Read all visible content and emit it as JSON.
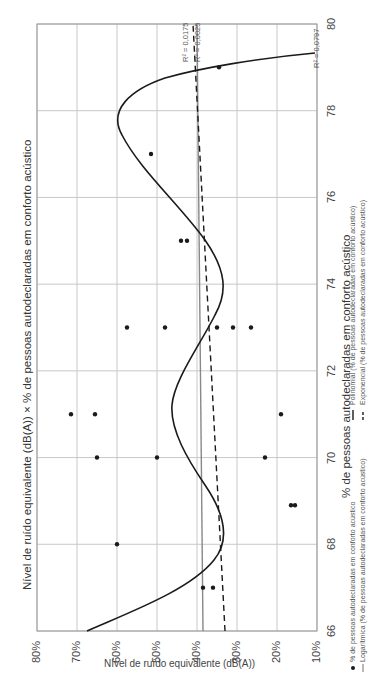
{
  "chart_data": {
    "type": "scatter",
    "orientation": "rotated-90-ccw",
    "title": "Nível de ruído equivalente (dB(A)) × % de pessoas autodeclaradas em conforto acústico",
    "xlabel": "Nível de ruído equivalente (dB(A))",
    "ylabel": "% de pessoas autodeclaradas em conforto acústico",
    "xlim": [
      66,
      80
    ],
    "ylim": [
      0.1,
      0.8
    ],
    "x_ticks": [
      "66",
      "68",
      "70",
      "72",
      "74",
      "76",
      "78",
      "80"
    ],
    "y_ticks": [
      "80%",
      "70%",
      "60%",
      "50%",
      "40%",
      "30%",
      "20%",
      "10%"
    ],
    "grid": true,
    "series": [
      {
        "name": "% de pessoas autodeclaradas em conforto acústico",
        "kind": "points",
        "points": [
          {
            "x": 67,
            "y": 0.385
          },
          {
            "x": 67,
            "y": 0.36
          },
          {
            "x": 68,
            "y": 0.6
          },
          {
            "x": 68.9,
            "y": 0.165
          },
          {
            "x": 68.9,
            "y": 0.155
          },
          {
            "x": 70,
            "y": 0.65
          },
          {
            "x": 70,
            "y": 0.5
          },
          {
            "x": 70,
            "y": 0.23
          },
          {
            "x": 71,
            "y": 0.715
          },
          {
            "x": 71,
            "y": 0.655
          },
          {
            "x": 71,
            "y": 0.19
          },
          {
            "x": 73,
            "y": 0.575
          },
          {
            "x": 73,
            "y": 0.48
          },
          {
            "x": 73,
            "y": 0.35
          },
          {
            "x": 73,
            "y": 0.31
          },
          {
            "x": 73,
            "y": 0.265
          },
          {
            "x": 75,
            "y": 0.44
          },
          {
            "x": 75,
            "y": 0.425
          },
          {
            "x": 77,
            "y": 0.515
          },
          {
            "x": 79,
            "y": 0.345
          }
        ]
      },
      {
        "name": "Logarítmica (% de pessoas autodeclaradas em conforto acústico)",
        "kind": "trendline",
        "style": "solid-gray",
        "r2": "R² = 0,0025",
        "y_at_66": 0.385,
        "y_at_80": 0.4
      },
      {
        "name": "Polinomial (% de pessoas autodeclaradas em conforto acústico)",
        "kind": "trendline",
        "style": "solid-black",
        "r2": "R² = 0,0797"
      },
      {
        "name": "Exponencial (% de pessoas autodeclaradas em conforto acústico)",
        "kind": "trendline",
        "style": "dashed",
        "r2": "R² = 0,0175",
        "y_at_66": 0.33,
        "y_at_80": 0.41
      }
    ],
    "legend": [
      {
        "marker": "dot",
        "label": "% de pessoas autodeclaradas em conforto acústico"
      },
      {
        "marker": "line-gray",
        "label": "Logarítmica (% de pessoas autodeclaradas em conforto acústico)"
      },
      {
        "marker": "line-black",
        "label": "Polinomial (% de pessoas autodeclaradas em conforto acústico)"
      },
      {
        "marker": "line-dashed",
        "label": "Exponencial (% de pessoas autodeclaradas em conforto acústico)"
      }
    ],
    "annotations": [
      "R² = 0,0175",
      "R² = 0,0025",
      "R² = 0,0797"
    ]
  },
  "labels": {
    "title": "Nível de ruído equivalente (dB(A)) × % de pessoas autodeclaradas em conforto acústico",
    "x_axis_title": "% de pessoas autodeclaradas em conforto acústico",
    "bottom_label": "Nível de ruído equivalente (dB(A))",
    "r2_exp": "R² = 0,0175",
    "r2_log": "R² = 0,0025",
    "r2_poly": "R² = 0,0797",
    "legend_points": "% de pessoas autodeclaradas em conforto acústico",
    "legend_log": "Logarítmica (% de pessoas autodeclaradas em conforto acústico)",
    "legend_poly": "Polinomial (% de pessoas autodeclaradas em conforto acústico)",
    "legend_exp": "Exponencial (% de pessoas autodeclaradas em conforto acústico)"
  },
  "colors": {
    "grid": "#c8c8c8",
    "frame": "#999999",
    "points": "#1a1a1a",
    "poly": "#1a1a1a",
    "log": "#888888",
    "exp": "#1a1a1a"
  }
}
